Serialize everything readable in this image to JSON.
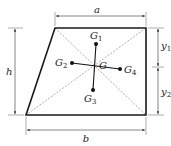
{
  "diagram": {
    "type": "trapezoid-centroid",
    "colors": {
      "outline": "#1a1a1a",
      "dimension": "#333333",
      "diagonal": "#8a8a8a",
      "point": "#111111"
    },
    "labels": {
      "top_width": "a",
      "bottom_width": "b",
      "height": "h",
      "y1_main": "y",
      "y1_sub": "1",
      "y2_main": "y",
      "y2_sub": "2",
      "centroid": "G",
      "g1_main": "G",
      "g1_sub": "1",
      "g2_main": "G",
      "g2_sub": "2",
      "g3_main": "G",
      "g3_sub": "3",
      "g4_main": "G",
      "g4_sub": "4"
    }
  }
}
